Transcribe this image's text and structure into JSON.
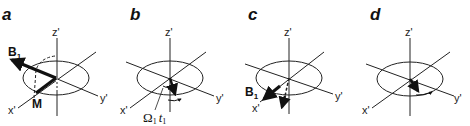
{
  "figure": {
    "panels": [
      {
        "letter": "a",
        "axes": {
          "z": "z'",
          "x": "x'",
          "y": "y'"
        },
        "labels": {
          "field": "B",
          "field_sub": "1",
          "magnetization": "M"
        }
      },
      {
        "letter": "b",
        "axes": {
          "z": "z'",
          "x": "x'",
          "y": "y'"
        },
        "labels": {
          "angle_omega": "Ω",
          "angle_omega_sub": "1",
          "angle_t": "t",
          "angle_t_sub": "1"
        }
      },
      {
        "letter": "c",
        "axes": {
          "z": "z'",
          "x": "x'",
          "y": "y'"
        },
        "labels": {
          "field": "B",
          "field_sub": "1"
        }
      },
      {
        "letter": "d",
        "axes": {
          "z": "z'",
          "x": "x'",
          "y": "y'"
        }
      }
    ]
  }
}
